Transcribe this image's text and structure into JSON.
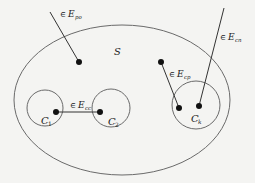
{
  "diagram": {
    "set": {
      "label": "S",
      "cx": 122,
      "cy": 100,
      "rx": 108,
      "ry": 75
    },
    "clusters": [
      {
        "id": "C1",
        "label": "C",
        "sub": "1",
        "cx": 45,
        "cy": 108,
        "r": 18
      },
      {
        "id": "C2",
        "label": "C",
        "sub": "2",
        "cx": 111,
        "cy": 108,
        "r": 19
      },
      {
        "id": "Ck",
        "label": "C",
        "sub": "k",
        "cx": 196,
        "cy": 105,
        "r": 24
      }
    ],
    "nodes": [
      {
        "id": "p",
        "x": 79,
        "y": 62
      },
      {
        "id": "q",
        "x": 161,
        "y": 62
      },
      {
        "id": "c1",
        "x": 56,
        "y": 112
      },
      {
        "id": "c2",
        "x": 100,
        "y": 112
      },
      {
        "id": "k1",
        "x": 179,
        "y": 108
      },
      {
        "id": "k2",
        "x": 199,
        "y": 106
      }
    ],
    "edges": [
      {
        "label_prefix": "∈",
        "label": "E",
        "sub": "po",
        "from": [
          50,
          12
        ],
        "to": [
          79,
          62
        ]
      },
      {
        "label_prefix": "∈",
        "label": "E",
        "sub": "cp",
        "from": [
          161,
          62
        ],
        "to": [
          179,
          108
        ]
      },
      {
        "label_prefix": "∈",
        "label": "E",
        "sub": "cc",
        "from": [
          56,
          112
        ],
        "to": [
          100,
          112
        ]
      },
      {
        "label_prefix": "∈",
        "label": "E",
        "sub": "cn",
        "from": [
          224,
          8
        ],
        "to": [
          199,
          106
        ]
      }
    ],
    "colors": {
      "line": "#555555",
      "node": "#111111",
      "background": "#f4f4f2"
    }
  }
}
